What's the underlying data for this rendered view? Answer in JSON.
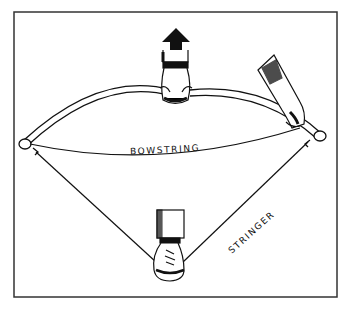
{
  "figure": {
    "labels": {
      "bowstring": "BOWSTRING",
      "stringer": "STRINGER"
    },
    "arrow_direction": "up",
    "colors": {
      "ink": "#111111",
      "background": "#ffffff",
      "frame": "#333333"
    }
  }
}
